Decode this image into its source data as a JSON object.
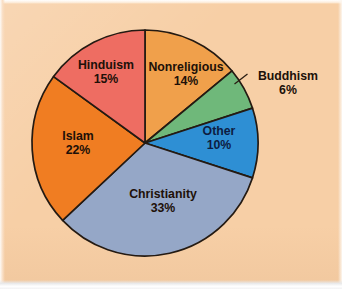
{
  "figure": {
    "kind": "pie-chart",
    "background_color": "#f7cfa6",
    "outline_color": "#241a12"
  },
  "chart_data": {
    "type": "pie",
    "title": "",
    "subtitle": "",
    "xlabel": "",
    "ylabel": "",
    "legend_position": "none",
    "grid": false,
    "labels_inside": true,
    "units": "percent",
    "total": 100,
    "categories": [
      "Nonreligious",
      "Buddhism",
      "Other",
      "Christianity",
      "Islam",
      "Hinduism"
    ],
    "values": [
      14,
      6,
      10,
      33,
      22,
      15
    ],
    "start_angle_deg": 0,
    "direction": "clockwise",
    "slices": [
      {
        "name": "Nonreligious",
        "label": "Nonreligious",
        "value": 14,
        "value_label": "14%",
        "color": "#f0a04b",
        "label_placement": "inside",
        "text_color": "#201008"
      },
      {
        "name": "Buddhism",
        "label": "Buddhism",
        "value": 6,
        "value_label": "6%",
        "color": "#6fb87a",
        "label_placement": "outside",
        "text_color": "#201008"
      },
      {
        "name": "Other",
        "label": "Other",
        "value": 10,
        "value_label": "10%",
        "color": "#2e8fd4",
        "label_placement": "inside",
        "text_color": "#0d1c42"
      },
      {
        "name": "Christianity",
        "label": "Christianity",
        "value": 33,
        "value_label": "33%",
        "color": "#95a7c7",
        "label_placement": "inside",
        "text_color": "#12182c"
      },
      {
        "name": "Islam",
        "label": "Islam",
        "value": 22,
        "value_label": "22%",
        "color": "#f07d22",
        "label_placement": "inside",
        "text_color": "#201008"
      },
      {
        "name": "Hinduism",
        "label": "Hinduism",
        "value": 15,
        "value_label": "15%",
        "color": "#ee6d62",
        "label_placement": "inside",
        "text_color": "#201008"
      }
    ]
  }
}
